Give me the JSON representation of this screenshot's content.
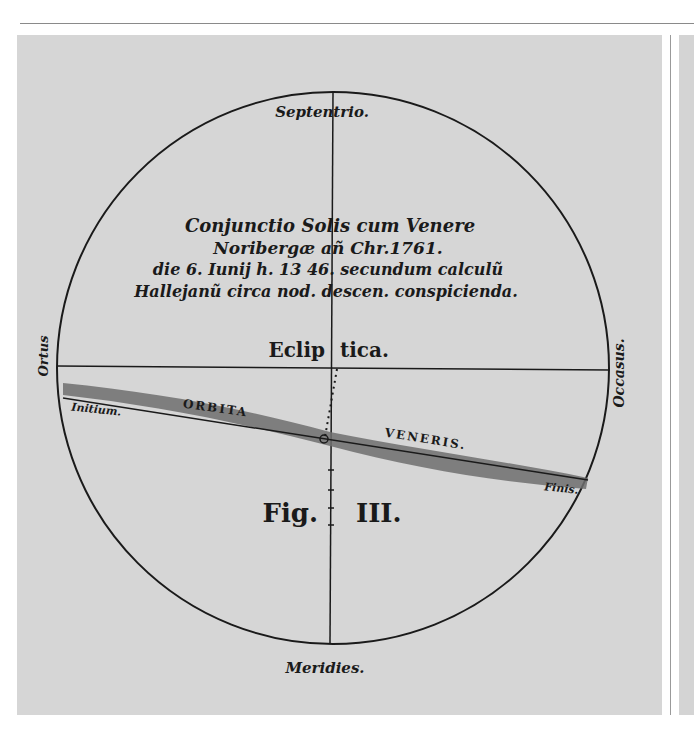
{
  "figure": {
    "title_lines": [
      "Conjunctio Solis cum Venere",
      "Noribergæ añ Chr.1761.",
      "die 6. Iunij h. 13 46. secundum calculũ",
      "Hallejanũ circa nod. descen. conspicienda."
    ],
    "compass": {
      "north": "Septentrio.",
      "south": "Meridies.",
      "east": "Ortus",
      "west": "Occasus."
    },
    "ecliptic_label_left": "Eclip",
    "ecliptic_label_right": "tica.",
    "orbit_label_left": "ORBITA",
    "orbit_label_right": "VENERIS.",
    "orbit_start": "Initium.",
    "orbit_end": "Finis.",
    "figure_label_left": "Fig.",
    "figure_label_right": "III."
  },
  "colors": {
    "paper": "#d6d6d6",
    "ink": "#1a1a1a",
    "orbit_band": "#6e6e6e"
  }
}
